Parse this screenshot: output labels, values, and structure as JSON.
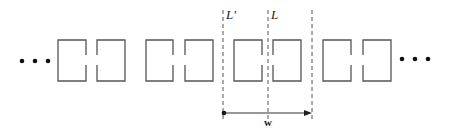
{
  "diagram": {
    "type": "periodic split-ring resonator array",
    "colors": {
      "stroke": "#555555",
      "dash": "#555555",
      "text": "#222222"
    },
    "ellipsis_left": "•••",
    "ellipsis_right": "•••",
    "labels": {
      "L_prime": "L'",
      "L": "L",
      "w": "w"
    },
    "box_top": 40,
    "box_bottom": 81,
    "gap_top": 55,
    "gap_bottom": 65,
    "pairs": [
      {
        "left": [
          58,
          86
        ],
        "right": [
          97,
          125
        ]
      },
      {
        "left": [
          146,
          173
        ],
        "right": [
          185,
          213
        ]
      },
      {
        "left": [
          234,
          262
        ],
        "right": [
          273,
          301
        ]
      },
      {
        "left": [
          323,
          351
        ],
        "right": [
          363,
          391
        ]
      }
    ],
    "dashed_lines_x": [
      223,
      268,
      312
    ],
    "arrow": {
      "x1": 224,
      "x2": 312,
      "y": 113
    }
  }
}
